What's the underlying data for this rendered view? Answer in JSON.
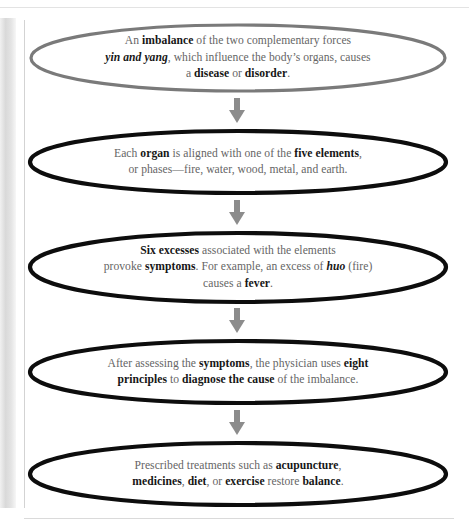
{
  "diagram": {
    "type": "flowchart",
    "orientation": "vertical-top-to-bottom",
    "node_shape": "ellipse",
    "connector": "down-arrow",
    "colors": {
      "first_node_stroke": "#7a7a7a",
      "node_stroke": "#0d0d0d",
      "node_fill": "#ffffff",
      "arrow": "#8c8c8c",
      "body_text": "#656565",
      "emphasis_text": "#161616",
      "page_background": "#ffffff",
      "rule": "#dadada"
    },
    "nodes": [
      {
        "id": "node-imbalance",
        "name": "imbalance-node",
        "stroke": "#7a7a7a",
        "text_plain": "An imbalance of the two complementary forces yin and yang, which influence the body's organs, causes a disease or disorder.",
        "lines": [
          [
            {
              "t": "An ",
              "s": "normal"
            },
            {
              "t": "imbalance",
              "s": "bold"
            },
            {
              "t": " of the two complementary forces",
              "s": "normal"
            }
          ],
          [
            {
              "t": "yin and yang",
              "s": "bold-italic"
            },
            {
              "t": ", which influence the body’s organs, causes",
              "s": "normal"
            }
          ],
          [
            {
              "t": "a ",
              "s": "normal"
            },
            {
              "t": "disease",
              "s": "bold"
            },
            {
              "t": " or ",
              "s": "normal"
            },
            {
              "t": "disorder",
              "s": "bold"
            },
            {
              "t": ".",
              "s": "normal"
            }
          ]
        ]
      },
      {
        "id": "node-organ",
        "name": "five-elements-node",
        "stroke": "#0d0d0d",
        "text_plain": "Each organ is aligned with one of the five elements, or phases—fire, water, wood, metal, and earth.",
        "lines": [
          [
            {
              "t": "Each ",
              "s": "normal"
            },
            {
              "t": "organ",
              "s": "bold"
            },
            {
              "t": " is aligned with one of the ",
              "s": "normal"
            },
            {
              "t": "five elements",
              "s": "bold"
            },
            {
              "t": ",",
              "s": "normal"
            }
          ],
          [
            {
              "t": "or phases—fire, water, wood, metal, and earth.",
              "s": "normal"
            }
          ]
        ]
      },
      {
        "id": "node-six-excesses",
        "name": "six-excesses-node",
        "stroke": "#0d0d0d",
        "text_plain": "Six excesses associated with the elements provoke symptoms. For example, an excess of huo (fire) causes a fever.",
        "lines": [
          [
            {
              "t": "Six excesses",
              "s": "bold"
            },
            {
              "t": " associated with the elements",
              "s": "normal"
            }
          ],
          [
            {
              "t": "provoke ",
              "s": "normal"
            },
            {
              "t": "symptoms",
              "s": "bold"
            },
            {
              "t": ". For example, an excess of ",
              "s": "normal"
            },
            {
              "t": "huo",
              "s": "bold-italic"
            },
            {
              "t": " (fire)",
              "s": "normal"
            }
          ],
          [
            {
              "t": "causes a ",
              "s": "normal"
            },
            {
              "t": "fever",
              "s": "bold"
            },
            {
              "t": ".",
              "s": "normal"
            }
          ]
        ]
      },
      {
        "id": "node-eight-principles",
        "name": "eight-principles-node",
        "stroke": "#0d0d0d",
        "text_plain": "After assessing the symptoms, the physician uses eight principles to diagnose the cause of the imbalance.",
        "lines": [
          [
            {
              "t": "After assessing the ",
              "s": "normal"
            },
            {
              "t": "symptoms",
              "s": "bold"
            },
            {
              "t": ", the physician uses ",
              "s": "normal"
            },
            {
              "t": "eight",
              "s": "bold"
            }
          ],
          [
            {
              "t": "principles",
              "s": "bold"
            },
            {
              "t": " to ",
              "s": "normal"
            },
            {
              "t": "diagnose the cause",
              "s": "bold"
            },
            {
              "t": " of the imbalance.",
              "s": "normal"
            }
          ]
        ]
      },
      {
        "id": "node-treatments",
        "name": "treatments-node",
        "stroke": "#0d0d0d",
        "text_plain": "Prescribed treatments such as acupuncture, medicines, diet, or exercise restore balance.",
        "lines": [
          [
            {
              "t": "Prescribed treatments such as ",
              "s": "normal"
            },
            {
              "t": "acupuncture",
              "s": "bold"
            },
            {
              "t": ",",
              "s": "normal"
            }
          ],
          [
            {
              "t": "medicines",
              "s": "bold"
            },
            {
              "t": ", ",
              "s": "normal"
            },
            {
              "t": "diet",
              "s": "bold"
            },
            {
              "t": ", or ",
              "s": "normal"
            },
            {
              "t": "exercise",
              "s": "bold"
            },
            {
              "t": " restore ",
              "s": "normal"
            },
            {
              "t": "balance",
              "s": "bold"
            },
            {
              "t": ".",
              "s": "normal"
            }
          ]
        ]
      }
    ],
    "arrows": [
      {
        "id": "arrow-1",
        "from": "node-imbalance",
        "to": "node-organ"
      },
      {
        "id": "arrow-2",
        "from": "node-organ",
        "to": "node-six-excesses"
      },
      {
        "id": "arrow-3",
        "from": "node-six-excesses",
        "to": "node-eight-principles"
      },
      {
        "id": "arrow-4",
        "from": "node-eight-principles",
        "to": "node-treatments"
      }
    ]
  }
}
